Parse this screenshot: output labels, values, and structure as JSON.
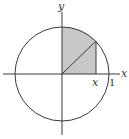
{
  "diagram": {
    "type": "unit-circle-region",
    "center": {
      "x": 62,
      "y": 74
    },
    "radius": 47,
    "point": {
      "x": 96,
      "y": 41
    },
    "labels": {
      "x_axis": "x",
      "y_axis": "y",
      "x_point": "x",
      "one": "1"
    },
    "colors": {
      "stroke": "#3a3a3a",
      "shade": "#c8c8c8",
      "background": "#ffffff"
    }
  }
}
